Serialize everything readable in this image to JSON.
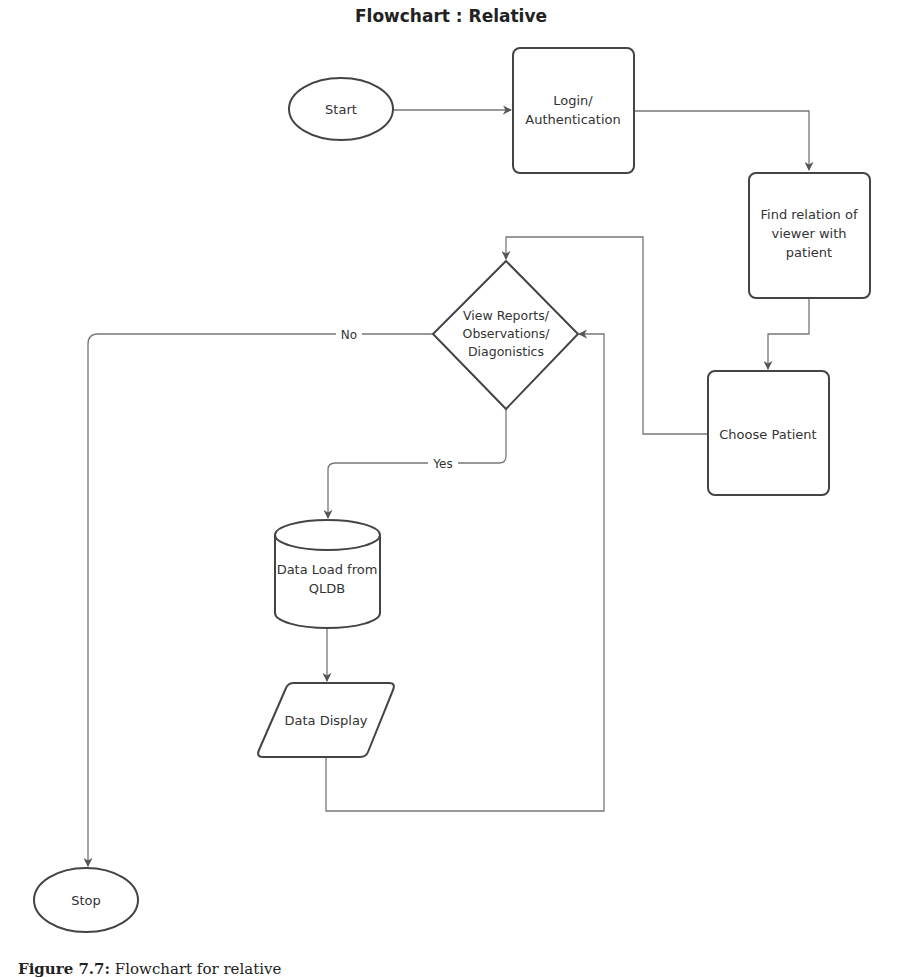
{
  "title": "Flowchart : Relative",
  "caption": {
    "label": "Figure 7.7:",
    "text": "Flowchart for relative"
  },
  "colors": {
    "shape_stroke": "#444444",
    "connector": "#777777",
    "text": "#333333",
    "background": "#ffffff"
  },
  "nodes": {
    "start": {
      "type": "terminator",
      "lines": [
        "Start"
      ]
    },
    "login": {
      "type": "process",
      "lines": [
        "Login/",
        "Authentication"
      ]
    },
    "find_relation": {
      "type": "process",
      "lines": [
        "Find relation of",
        "viewer with",
        "patient"
      ]
    },
    "choose_patient": {
      "type": "process",
      "lines": [
        "Choose Patient"
      ]
    },
    "decision": {
      "type": "decision",
      "lines": [
        "View Reports/",
        "Observations/",
        "Diagonistics"
      ]
    },
    "data_load": {
      "type": "database",
      "lines": [
        "Data Load from",
        "QLDB"
      ]
    },
    "data_display": {
      "type": "io",
      "lines": [
        "Data Display"
      ]
    },
    "stop": {
      "type": "terminator",
      "lines": [
        "Stop"
      ]
    }
  },
  "edges": [
    {
      "from": "start",
      "to": "login",
      "label": ""
    },
    {
      "from": "login",
      "to": "find_relation",
      "label": ""
    },
    {
      "from": "find_relation",
      "to": "choose_patient",
      "label": ""
    },
    {
      "from": "choose_patient",
      "to": "decision",
      "label": ""
    },
    {
      "from": "decision",
      "to": "stop",
      "label": "No"
    },
    {
      "from": "decision",
      "to": "data_load",
      "label": "Yes"
    },
    {
      "from": "data_load",
      "to": "data_display",
      "label": ""
    },
    {
      "from": "data_display",
      "to": "decision",
      "label": ""
    }
  ]
}
